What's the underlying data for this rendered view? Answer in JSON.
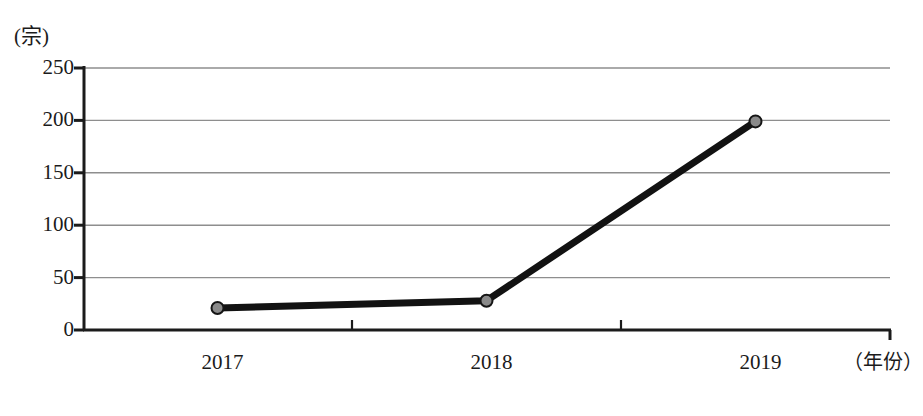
{
  "chart_data": {
    "type": "line",
    "title": "",
    "subtitle": "",
    "xlabel": "（年份）",
    "ylabel": "(宗)",
    "categories": [
      "2017",
      "2018",
      "2019"
    ],
    "x": [
      2017,
      2018,
      2019
    ],
    "values": [
      21,
      28,
      199
    ],
    "series": [
      {
        "name": "",
        "values": [
          21,
          28,
          199
        ]
      }
    ],
    "ylim": [
      0,
      250
    ],
    "y_ticks": [
      0,
      50,
      100,
      150,
      200,
      250
    ],
    "y_tick_labels": [
      "0",
      "50",
      "100",
      "150",
      "200",
      "250"
    ],
    "x_tick_labels": [
      "2017",
      "2018",
      "2019"
    ],
    "grid": "horizontal",
    "legend": "none",
    "annotations": [],
    "line_color": "#121212",
    "marker_fill_color": "#8a8a8a",
    "marker_edge_color": "#151515",
    "gridline_color": "#8e8e8e",
    "axis_color": "#1b1b1b",
    "background_color": "#ffffff"
  },
  "axes": {
    "y_unit": "(宗)",
    "x_unit": "（年份）"
  }
}
